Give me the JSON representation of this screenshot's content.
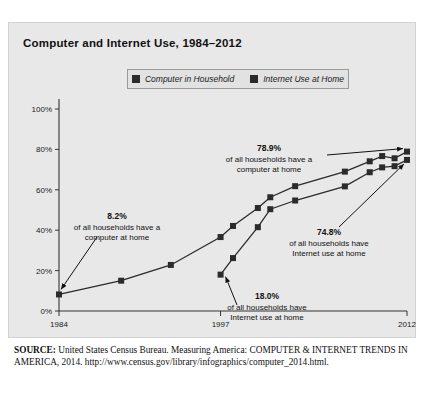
{
  "figure": {
    "title": "Computer and Internet Use, 1984–2012"
  },
  "legend": {
    "items": [
      {
        "label": "Computer in Household",
        "color": "#2b2b2b"
      },
      {
        "label": "Internet Use at Home",
        "color": "#2b2b2b"
      }
    ]
  },
  "source": {
    "prefix": "SOURCE:",
    "text": " United States Census Bureau. Measuring America: COMPUTER & INTERNET TRENDS IN AMERICA, 2014. http://www.census.gov/library/infographics/computer_2014.html."
  },
  "chart_data": {
    "type": "line",
    "title": "Computer and Internet Use, 1984–2012",
    "xlabel": "",
    "ylabel": "",
    "xlim": [
      1984,
      2012
    ],
    "ylim": [
      0,
      100
    ],
    "yticks": [
      0,
      20,
      40,
      60,
      80,
      100
    ],
    "ytick_labels": [
      "0%",
      "20%",
      "40%",
      "60%",
      "80%",
      "100%"
    ],
    "xticks": [
      1984,
      1997,
      2012
    ],
    "xtick_labels": [
      "1984",
      "1997",
      "2012"
    ],
    "grid": false,
    "legend_position": "top-center",
    "marker": "square",
    "series": [
      {
        "name": "Computer in Household",
        "color": "#2b2b2b",
        "x": [
          1984,
          1989,
          1993,
          1997,
          1998,
          2000,
          2001,
          2003,
          2007,
          2009,
          2010,
          2011,
          2012
        ],
        "values": [
          8.2,
          15.0,
          22.8,
          36.6,
          42.1,
          51.0,
          56.3,
          61.8,
          69.0,
          74.1,
          76.7,
          75.6,
          78.9
        ]
      },
      {
        "name": "Internet Use at Home",
        "color": "#2b2b2b",
        "x": [
          1997,
          1998,
          2000,
          2001,
          2003,
          2007,
          2009,
          2010,
          2011,
          2012
        ],
        "values": [
          18.0,
          26.2,
          41.5,
          50.4,
          54.7,
          61.7,
          68.7,
          71.1,
          71.7,
          74.8
        ]
      }
    ],
    "annotations": [
      {
        "value": "8.2%",
        "lines": [
          "of all households have a",
          "computer at home"
        ],
        "points_to": {
          "x": 1984,
          "y": 8.2
        }
      },
      {
        "value": "78.9%",
        "lines": [
          "of all households have a",
          "computer at home"
        ],
        "points_to": {
          "x": 2012,
          "y": 78.9
        }
      },
      {
        "value": "74.8%",
        "lines": [
          "of all households have",
          "Internet use at home"
        ],
        "points_to": {
          "x": 2012,
          "y": 74.8
        }
      },
      {
        "value": "18.0%",
        "lines": [
          "of all households have",
          "Internet use at home"
        ],
        "points_to": {
          "x": 1997,
          "y": 18.0
        }
      }
    ]
  }
}
